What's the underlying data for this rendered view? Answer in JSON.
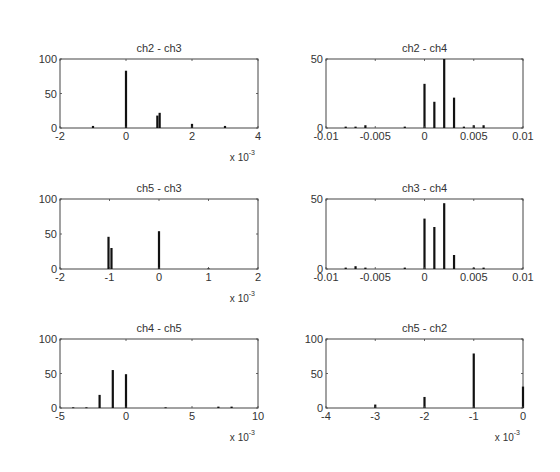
{
  "figure": {
    "background": "#ffffff",
    "bar_color": "#111111",
    "axis_color": "#444444"
  },
  "chart_data": [
    {
      "type": "bar",
      "title": "ch2 - ch3",
      "xlabel": "",
      "ylabel": "",
      "xlim": [
        -0.002,
        0.004
      ],
      "ylim": [
        0,
        100
      ],
      "xticks": [
        -0.002,
        0,
        0.002,
        0.004
      ],
      "xtick_labels": [
        "-2",
        "0",
        "2",
        "4"
      ],
      "yticks": [
        0,
        50,
        100
      ],
      "ytick_labels": [
        "0",
        "50",
        "100"
      ],
      "x_multiplier_label": "x 10",
      "x_multiplier_exp": "-3",
      "bars": [
        {
          "x": -0.001,
          "y": 3
        },
        {
          "x": 0.0,
          "y": 83
        },
        {
          "x": 0.00095,
          "y": 18
        },
        {
          "x": 0.00102,
          "y": 22
        },
        {
          "x": 0.002,
          "y": 6
        },
        {
          "x": 0.003,
          "y": 3
        }
      ],
      "box": {
        "left": 60,
        "top": 59,
        "right": 258,
        "bottom": 128
      }
    },
    {
      "type": "bar",
      "title": "ch2 - ch4",
      "xlabel": "",
      "ylabel": "",
      "xlim": [
        -0.01,
        0.01
      ],
      "ylim": [
        0,
        50
      ],
      "xticks": [
        -0.01,
        -0.005,
        0,
        0.005,
        0.01
      ],
      "xtick_labels": [
        "-0.01",
        "-0.005",
        "0",
        "0.005",
        "0.01"
      ],
      "yticks": [
        0,
        50
      ],
      "ytick_labels": [
        "0",
        "50"
      ],
      "x_multiplier_label": "",
      "x_multiplier_exp": "",
      "bars": [
        {
          "x": -0.008,
          "y": 1
        },
        {
          "x": -0.007,
          "y": 1
        },
        {
          "x": -0.006,
          "y": 2
        },
        {
          "x": -0.002,
          "y": 1
        },
        {
          "x": 0.0,
          "y": 32
        },
        {
          "x": 0.001,
          "y": 19
        },
        {
          "x": 0.002,
          "y": 50
        },
        {
          "x": 0.003,
          "y": 22
        },
        {
          "x": 0.004,
          "y": 1
        },
        {
          "x": 0.005,
          "y": 2
        },
        {
          "x": 0.006,
          "y": 2
        }
      ],
      "box": {
        "left": 326,
        "top": 59,
        "right": 523,
        "bottom": 128
      }
    },
    {
      "type": "bar",
      "title": "ch5 - ch3",
      "xlabel": "",
      "ylabel": "",
      "xlim": [
        -0.002,
        0.002
      ],
      "ylim": [
        0,
        100
      ],
      "xticks": [
        -0.002,
        -0.001,
        0,
        0.001,
        0.002
      ],
      "xtick_labels": [
        "-2",
        "-1",
        "0",
        "1",
        "2"
      ],
      "yticks": [
        0,
        50,
        100
      ],
      "ytick_labels": [
        "0",
        "50",
        "100"
      ],
      "x_multiplier_label": "x 10",
      "x_multiplier_exp": "-3",
      "bars": [
        {
          "x": -0.00102,
          "y": 46
        },
        {
          "x": -0.00096,
          "y": 30
        },
        {
          "x": 0.0,
          "y": 54
        },
        {
          "x": 0.001,
          "y": 1
        }
      ],
      "box": {
        "left": 60,
        "top": 199,
        "right": 258,
        "bottom": 269
      }
    },
    {
      "type": "bar",
      "title": "ch3 - ch4",
      "xlabel": "",
      "ylabel": "",
      "xlim": [
        -0.01,
        0.01
      ],
      "ylim": [
        0,
        50
      ],
      "xticks": [
        -0.01,
        -0.005,
        0,
        0.005,
        0.01
      ],
      "xtick_labels": [
        "-0.01",
        "-0.005",
        "0",
        "0.005",
        "0.01"
      ],
      "yticks": [
        0,
        50
      ],
      "ytick_labels": [
        "0",
        "50"
      ],
      "x_multiplier_label": "",
      "x_multiplier_exp": "",
      "bars": [
        {
          "x": -0.008,
          "y": 1
        },
        {
          "x": -0.007,
          "y": 2
        },
        {
          "x": -0.006,
          "y": 1
        },
        {
          "x": -0.002,
          "y": 1
        },
        {
          "x": 0.0,
          "y": 36
        },
        {
          "x": 0.001,
          "y": 30
        },
        {
          "x": 0.002,
          "y": 47
        },
        {
          "x": 0.003,
          "y": 10
        },
        {
          "x": 0.005,
          "y": 1
        },
        {
          "x": 0.006,
          "y": 1
        }
      ],
      "box": {
        "left": 326,
        "top": 199,
        "right": 523,
        "bottom": 269
      }
    },
    {
      "type": "bar",
      "title": "ch4 - ch5",
      "xlabel": "",
      "ylabel": "",
      "xlim": [
        -0.005,
        0.01
      ],
      "ylim": [
        0,
        100
      ],
      "xticks": [
        -0.005,
        0,
        0.005,
        0.01
      ],
      "xtick_labels": [
        "-5",
        "0",
        "5",
        "10"
      ],
      "yticks": [
        0,
        50,
        100
      ],
      "ytick_labels": [
        "0",
        "50",
        "100"
      ],
      "x_multiplier_label": "x 10",
      "x_multiplier_exp": "-3",
      "bars": [
        {
          "x": -0.004,
          "y": 1
        },
        {
          "x": -0.003,
          "y": 1
        },
        {
          "x": -0.002,
          "y": 19
        },
        {
          "x": -0.001,
          "y": 55
        },
        {
          "x": 0.0,
          "y": 49
        },
        {
          "x": 0.003,
          "y": 1
        },
        {
          "x": 0.007,
          "y": 2
        },
        {
          "x": 0.008,
          "y": 2
        }
      ],
      "box": {
        "left": 60,
        "top": 339,
        "right": 258,
        "bottom": 408
      }
    },
    {
      "type": "bar",
      "title": "ch5 - ch2",
      "xlabel": "",
      "ylabel": "",
      "xlim": [
        -0.004,
        0.0
      ],
      "ylim": [
        0,
        100
      ],
      "xticks": [
        -0.004,
        -0.003,
        -0.002,
        -0.001,
        0
      ],
      "xtick_labels": [
        "-4",
        "-3",
        "-2",
        "-1",
        "0"
      ],
      "yticks": [
        0,
        50,
        100
      ],
      "ytick_labels": [
        "0",
        "50",
        "100"
      ],
      "x_multiplier_label": "x 10",
      "x_multiplier_exp": "-3",
      "bars": [
        {
          "x": -0.003,
          "y": 5
        },
        {
          "x": -0.002,
          "y": 16
        },
        {
          "x": -0.001,
          "y": 79
        },
        {
          "x": 0.0,
          "y": 31
        }
      ],
      "box": {
        "left": 326,
        "top": 339,
        "right": 523,
        "bottom": 408
      }
    }
  ]
}
